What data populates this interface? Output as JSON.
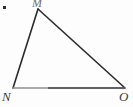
{
  "figure": {
    "name": "triangle-mno",
    "background_color": "#fdfdfd",
    "canvas": {
      "width": 133,
      "height": 107
    },
    "vertices": [
      {
        "id": "M",
        "label": "M",
        "x": 38,
        "y": 9
      },
      {
        "id": "N",
        "label": "N",
        "x": 13,
        "y": 88
      },
      {
        "id": "O",
        "label": "O",
        "x": 125,
        "y": 88
      }
    ],
    "edges": [
      {
        "id": "MN",
        "from": "M",
        "to": "N",
        "color": "#2b2b2b",
        "width": 1.6
      },
      {
        "id": "MO",
        "from": "M",
        "to": "O",
        "color": "#2b2b2b",
        "width": 1.6
      },
      {
        "id": "NO",
        "from": "N",
        "to": "O",
        "color": "#8d8d8d",
        "width": 1.6
      }
    ],
    "marks": [
      {
        "id": "corner-dot",
        "x": 4,
        "y": 7,
        "size": 3,
        "color": "#2e2e2e"
      }
    ]
  },
  "labels": {
    "apex": "M",
    "bottom_left": "N",
    "bottom_right": "O"
  }
}
